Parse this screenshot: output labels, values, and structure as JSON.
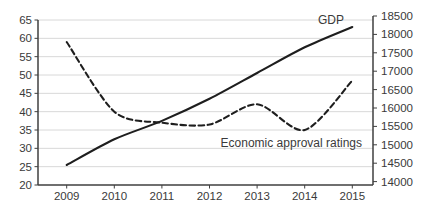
{
  "chart_data": {
    "type": "line",
    "title": "",
    "xlabel": "",
    "ylabel": "",
    "grid": "horizontal",
    "legend": "none (inline annotations)",
    "categories": [
      "2009",
      "2010",
      "2011",
      "2012",
      "2013",
      "2014",
      "2015"
    ],
    "series": [
      {
        "name": "GDP",
        "axis": "right",
        "line_style": "solid",
        "values": [
          14450,
          15150,
          15650,
          16250,
          16950,
          17650,
          18200
        ]
      },
      {
        "name": "Economic approval ratings",
        "axis": "left",
        "line_style": "dashed",
        "values": [
          59,
          40,
          37,
          36.5,
          42,
          35,
          48.5
        ]
      }
    ],
    "left_axis": {
      "min": 20,
      "max": 65,
      "step": 5,
      "tick_labels": [
        "65",
        "60",
        "55",
        "50",
        "45",
        "40",
        "35",
        "30",
        "25",
        "20"
      ]
    },
    "right_axis": {
      "min": 14000,
      "max": 18500,
      "step": 500,
      "tick_labels": [
        "18500",
        "18000",
        "17500",
        "17000",
        "16500",
        "16000",
        "15500",
        "15000",
        "14500",
        "14000"
      ]
    },
    "annotations": [
      {
        "id": "gdp-label",
        "text": "GDP"
      },
      {
        "id": "approval-label",
        "text": "Economic approval ratings"
      }
    ],
    "colors": {
      "line": "#1e1e1e",
      "axis": "#3f3f3f",
      "grid": "#d8d8d8",
      "text": "#3a3a3a",
      "background": "#ffffff"
    }
  }
}
